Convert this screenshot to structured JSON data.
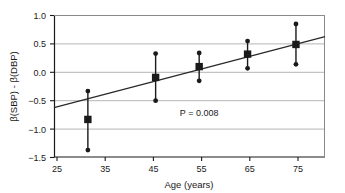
{
  "chart_data": {
    "type": "scatter",
    "title": "",
    "xlabel": "Age (years)",
    "ylabel": "β(SBP) - β(DBP)",
    "xlim": [
      23,
      79
    ],
    "ylim": [
      -1.5,
      1.0
    ],
    "xticks": [
      25,
      35,
      45,
      55,
      65,
      75
    ],
    "xtick_labels": [
      "25",
      "35",
      "45",
      "55",
      "65",
      "75"
    ],
    "yticks": [
      -1.5,
      -1.0,
      -0.5,
      0.0,
      0.5,
      1.0
    ],
    "ytick_labels": [
      "−1.5",
      "−1.0",
      "−0.5",
      "0.0",
      "0.5",
      "1.0"
    ],
    "grid": true,
    "grid_axis": "y",
    "legend": false,
    "marker": "square",
    "errorbar": "vertical",
    "x": [
      30,
      44,
      53,
      63,
      73
    ],
    "values": [
      -0.83,
      -0.09,
      0.1,
      0.32,
      0.49
    ],
    "err_low": [
      -1.37,
      -0.5,
      -0.15,
      0.07,
      0.14
    ],
    "err_high": [
      -0.33,
      0.33,
      0.34,
      0.55,
      0.85
    ],
    "points": [
      {
        "x": 30,
        "y": -0.83,
        "low": -1.37,
        "high": -0.33
      },
      {
        "x": 44,
        "y": -0.09,
        "low": -0.5,
        "high": 0.33
      },
      {
        "x": 53,
        "y": 0.1,
        "low": -0.15,
        "high": 0.34
      },
      {
        "x": 63,
        "y": 0.32,
        "low": 0.07,
        "high": 0.55
      },
      {
        "x": 73,
        "y": 0.49,
        "low": 0.14,
        "high": 0.85
      }
    ],
    "trendline": {
      "x0": 23,
      "y0": -0.62,
      "x1": 79,
      "y1": 0.63
    },
    "annotations": [
      {
        "text": "P = 0.008",
        "x": 53,
        "y": -0.77
      }
    ],
    "colors": {
      "marker": "#1a1a1a",
      "errorbar": "#1a1a1a",
      "trendline": "#2a2a2a",
      "grid": "#b5b5b5",
      "axis": "#1a1a1a",
      "background": "#ffffff",
      "text": "#1a1a1a"
    }
  },
  "annotation_pvalue": "P = 0.008",
  "axis": {
    "x_title": "Age (years)",
    "y_title": "β(SBP) - β(DBP)"
  },
  "xtick_labels": {
    "t0": "25",
    "t1": "35",
    "t2": "45",
    "t3": "55",
    "t4": "65",
    "t5": "75"
  },
  "ytick_labels": {
    "t0": "1.0",
    "t1": "0.5",
    "t2": "0.0",
    "t3": "−0.5",
    "t4": "−1.0",
    "t5": "−1.5"
  }
}
